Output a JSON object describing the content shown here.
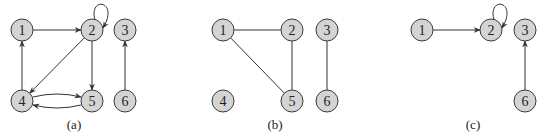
{
  "panels": [
    {
      "id": "a",
      "caption": "(a)",
      "type": "directed",
      "nodes": [
        {
          "id": "1",
          "label": "1",
          "x": 22,
          "y": 30
        },
        {
          "id": "2",
          "label": "2",
          "x": 92,
          "y": 30
        },
        {
          "id": "3",
          "label": "3",
          "x": 125,
          "y": 30
        },
        {
          "id": "4",
          "label": "4",
          "x": 22,
          "y": 101
        },
        {
          "id": "5",
          "label": "5",
          "x": 92,
          "y": 101
        },
        {
          "id": "6",
          "label": "6",
          "x": 125,
          "y": 101
        }
      ],
      "edges": [
        {
          "from": "1",
          "to": "2"
        },
        {
          "from": "2",
          "to": "2",
          "self_loop": true
        },
        {
          "from": "2",
          "to": "4"
        },
        {
          "from": "2",
          "to": "5"
        },
        {
          "from": "4",
          "to": "1"
        },
        {
          "from": "4",
          "to": "5",
          "curve": "up"
        },
        {
          "from": "5",
          "to": "4",
          "curve": "down"
        },
        {
          "from": "6",
          "to": "3"
        }
      ],
      "caption_pos": {
        "x": 74,
        "y": 129
      }
    },
    {
      "id": "b",
      "caption": "(b)",
      "type": "undirected",
      "nodes": [
        {
          "id": "1",
          "label": "1",
          "x": 223,
          "y": 30
        },
        {
          "id": "2",
          "label": "2",
          "x": 292,
          "y": 30
        },
        {
          "id": "3",
          "label": "3",
          "x": 327,
          "y": 30
        },
        {
          "id": "4",
          "label": "4",
          "x": 223,
          "y": 101
        },
        {
          "id": "5",
          "label": "5",
          "x": 292,
          "y": 101
        },
        {
          "id": "6",
          "label": "6",
          "x": 327,
          "y": 101
        }
      ],
      "edges": [
        {
          "from": "1",
          "to": "2"
        },
        {
          "from": "1",
          "to": "5"
        },
        {
          "from": "2",
          "to": "5"
        },
        {
          "from": "3",
          "to": "6"
        }
      ],
      "caption_pos": {
        "x": 275,
        "y": 129
      }
    },
    {
      "id": "c",
      "caption": "(c)",
      "type": "directed",
      "nodes": [
        {
          "id": "1",
          "label": "1",
          "x": 422,
          "y": 30
        },
        {
          "id": "2",
          "label": "2",
          "x": 491,
          "y": 30
        },
        {
          "id": "3",
          "label": "3",
          "x": 525,
          "y": 30
        },
        {
          "id": "6",
          "label": "6",
          "x": 525,
          "y": 101
        }
      ],
      "edges": [
        {
          "from": "1",
          "to": "2"
        },
        {
          "from": "2",
          "to": "2",
          "self_loop": true
        },
        {
          "from": "6",
          "to": "3"
        }
      ],
      "caption_pos": {
        "x": 473,
        "y": 129
      }
    }
  ],
  "style": {
    "node_fill": "#d4d4d4",
    "node_stroke": "#3a3a3a",
    "edge_color": "#333333",
    "node_radius": 11
  }
}
